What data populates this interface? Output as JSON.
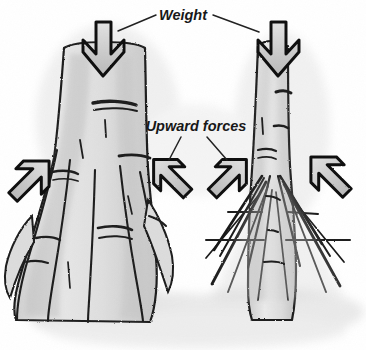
{
  "figure": {
    "kind": "hand-drawn-diagram",
    "background_color": "#ffffff"
  },
  "labels": {
    "weight": "Weight",
    "upward_forces": "Upward forces"
  },
  "colors": {
    "ink": "#1a1a1a",
    "trunk_fill": "#d8d8d8",
    "trunk_fill_light": "#e6e6e6",
    "ground_shadow": "#dcdcdc",
    "arrow_fill": "#c9c9c9",
    "arrow_stroke": "#111111",
    "leader_line": "#222222",
    "text": "#161616"
  },
  "arrows": {
    "weight_arrows": [
      {
        "name": "weight-arrow-left-tree",
        "direction": "down",
        "x": 103,
        "y": 30
      },
      {
        "name": "weight-arrow-right-tree",
        "direction": "down",
        "x": 278,
        "y": 30
      }
    ],
    "upward_arrows": [
      {
        "name": "upward-arrow-far-left",
        "direction": "up-right",
        "x": 30,
        "y": 180
      },
      {
        "name": "upward-arrow-center-left",
        "direction": "up-left",
        "x": 172,
        "y": 178
      },
      {
        "name": "upward-arrow-center-right",
        "direction": "up-right",
        "x": 228,
        "y": 178
      },
      {
        "name": "upward-arrow-far-right",
        "direction": "up-left",
        "x": 330,
        "y": 176
      }
    ]
  },
  "trees": [
    {
      "name": "buttress-root-tree",
      "side": "left",
      "root_type": "buttress",
      "trunk_x": 100
    },
    {
      "name": "stilt-root-tree",
      "side": "right",
      "root_type": "stilt",
      "trunk_x": 272
    }
  ]
}
